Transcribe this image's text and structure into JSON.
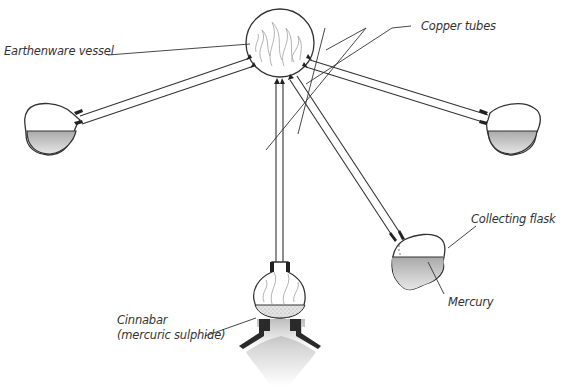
{
  "diagram": {
    "labels": {
      "earthenware_vessel": "Earthenware vessel",
      "copper_tubes": "Copper tubes",
      "collecting_flask": "Collecting flask",
      "mercury": "Mercury",
      "cinnabar_line1": "Cinnabar",
      "cinnabar_line2": "(mercuric sulphide)"
    },
    "components": [
      {
        "name": "earthenware-vessel",
        "contains": "flames"
      },
      {
        "name": "left-flask",
        "contains": "liquid"
      },
      {
        "name": "right-flask",
        "contains": "liquid"
      },
      {
        "name": "collecting-flask",
        "contains": "mercury"
      },
      {
        "name": "cinnabar-flask",
        "contains": "cinnabar, flames"
      },
      {
        "name": "furnace",
        "contains": "fire"
      }
    ],
    "colors": {
      "line": "#333333",
      "liquid_top": "#b5b5b5",
      "liquid_bottom": "#e2e2e2",
      "furnace": "#2a2a2a",
      "flame": "#aaaaaa"
    }
  }
}
